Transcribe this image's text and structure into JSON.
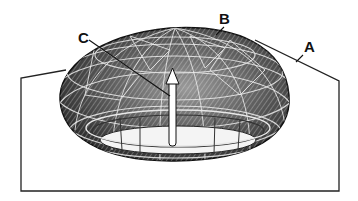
{
  "figure": {
    "type": "patent-line-drawing",
    "labels": [
      {
        "id": "A",
        "text": "A",
        "x": 304,
        "y": 39,
        "target": "base-plate-edge"
      },
      {
        "id": "B",
        "text": "B",
        "x": 219,
        "y": 11,
        "target": "dome-top-lattice"
      },
      {
        "id": "C",
        "text": "C",
        "x": 78,
        "y": 30,
        "target": "diagonal-strut"
      }
    ],
    "colors": {
      "ink": "#111111",
      "background": "#ffffff",
      "shade_dark": "#3a3a3a",
      "shade_mid": "#8a8a8a",
      "shade_light": "#d8d8d8"
    },
    "arrow": {
      "direction": "up",
      "x": 172,
      "y_top": 70,
      "y_bottom": 146
    }
  }
}
